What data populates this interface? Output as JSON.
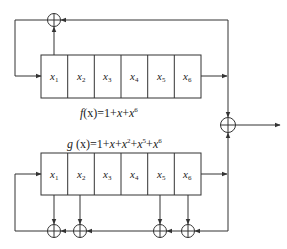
{
  "diagram": {
    "colors": {
      "stroke": "#333333",
      "background": "#ffffff"
    },
    "register_f": {
      "cells": [
        {
          "base": "x",
          "sub": "1"
        },
        {
          "base": "x",
          "sub": "2"
        },
        {
          "base": "x",
          "sub": "3"
        },
        {
          "base": "x",
          "sub": "4"
        },
        {
          "base": "x",
          "sub": "5"
        },
        {
          "base": "x",
          "sub": "6"
        }
      ],
      "caption": {
        "fn": "f",
        "var": "(x)",
        "eq": "=1+",
        "t1": "x",
        "plus": "+",
        "t2": "x",
        "t2sup": "6"
      },
      "taps": [
        "x1",
        "x6"
      ]
    },
    "register_g": {
      "cells": [
        {
          "base": "x",
          "sub": "1"
        },
        {
          "base": "x",
          "sub": "2"
        },
        {
          "base": "x",
          "sub": "3"
        },
        {
          "base": "x",
          "sub": "4"
        },
        {
          "base": "x",
          "sub": "5"
        },
        {
          "base": "x",
          "sub": "6"
        }
      ],
      "caption": {
        "fn": "g",
        "var": " (x)",
        "eq": "=1+",
        "t1": "x",
        "p1": "+",
        "t2": "x",
        "t2sup": "2",
        "p2": "+",
        "t3": "x",
        "t3sup": "5",
        "p3": "+",
        "t4": "x",
        "t4sup": "6"
      },
      "taps": [
        "x1",
        "x2",
        "x5",
        "x6"
      ]
    },
    "combiner": "xor-output"
  }
}
